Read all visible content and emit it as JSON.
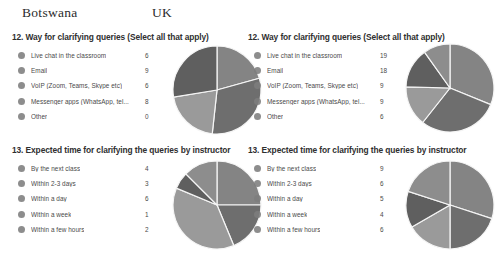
{
  "headers": {
    "left_country": "Botswana",
    "right_country": "UK"
  },
  "colors": {
    "slice_dark": "#6e6e6e",
    "slice_mid": "#848484",
    "slice_light": "#9a9a9a",
    "slice_darkest": "#5f5f5f",
    "slice_pale": "#8d8d8d",
    "legend_dot": "#7d7d7d",
    "divider": "#f2f2f2",
    "text": "#4a4a4a",
    "background": "#ffffff"
  },
  "panels": {
    "bw_q12": {
      "title": "12. Way for clarifying queries (Select all that apply)",
      "country": "Botswana"
    },
    "uk_q12": {
      "title": "12. Way for clarifying queries (Select all that apply)",
      "country": "UK"
    },
    "bw_q13": {
      "title": "13. Expected time for clarifying the queries by instructor",
      "country": "Botswana"
    },
    "uk_q13": {
      "title": "13. Expected time for clarifying the queries by instructor",
      "country": "UK"
    }
  },
  "chart_data": [
    {
      "id": "bw_q12",
      "type": "pie",
      "title": "12. Way for clarifying queries (Select all that apply)",
      "country": "Botswana",
      "legend_position": "left",
      "categories": [
        "Live chat in the classroom",
        "Email",
        "VoIP (Zoom, Teams, Skype etc)",
        "Messenger apps (WhatsApp, tel...",
        "Other"
      ],
      "values": [
        6,
        9,
        6,
        8,
        0
      ],
      "total": 29
    },
    {
      "id": "uk_q12",
      "type": "pie",
      "title": "12. Way for clarifying queries (Select all that apply)",
      "country": "UK",
      "legend_position": "left",
      "categories": [
        "Live chat in the classroom",
        "Email",
        "VoIP (Zoom, Teams, Skype etc)",
        "Messenger apps (WhatsApp, tel...",
        "Other"
      ],
      "values": [
        19,
        18,
        9,
        9,
        6
      ],
      "total": 61
    },
    {
      "id": "bw_q13",
      "type": "pie",
      "title": "13. Expected time for clarifying the queries by instructor",
      "country": "Botswana",
      "legend_position": "left",
      "categories": [
        "By the next class",
        "Within 2-3 days",
        "Within a day",
        "Within a week",
        "Within a few hours"
      ],
      "values": [
        4,
        3,
        6,
        1,
        2
      ],
      "total": 16
    },
    {
      "id": "uk_q13",
      "type": "pie",
      "title": "13. Expected time for clarifying the queries by instructor",
      "country": "UK",
      "legend_position": "left",
      "categories": [
        "By the next class",
        "Within 2-3 days",
        "Within a day",
        "Within a week",
        "Within a few hours"
      ],
      "values": [
        9,
        6,
        5,
        4,
        6
      ],
      "total": 30
    }
  ]
}
